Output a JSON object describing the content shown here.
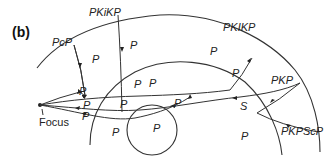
{
  "panel_label": "(b)",
  "phases": {
    "pcp": "PcP",
    "pkikp_upper": "PKiKP",
    "pkikp_lower": "PKIKP",
    "pkp": "PKP",
    "pkpscp": "PKPScP"
  },
  "segment_labels": {
    "p": "P",
    "s": "S"
  },
  "source_label": "Focus",
  "colors": {
    "line": "#333333",
    "text": "#222222",
    "background": "#ffffff"
  }
}
